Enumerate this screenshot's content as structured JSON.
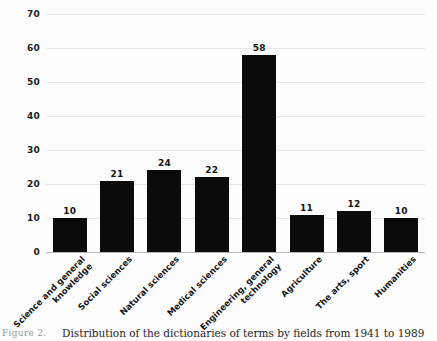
{
  "figure": {
    "caption_label": "Figure 2.",
    "caption_text": "Distribution of the dictionaries of terms by fields from 1941 to 1989",
    "bar_color": "#0b0b0b",
    "grid_color": "#e6e6e6",
    "axis_color": "#b9b9b9",
    "background": "#fdfdfd"
  },
  "chart_data": {
    "type": "bar",
    "title": "",
    "subtitle": "",
    "xlabel": "",
    "ylabel": "",
    "ylim": [
      0,
      70
    ],
    "yticks": [
      0,
      10,
      20,
      30,
      40,
      50,
      60,
      70
    ],
    "ytick_labels": [
      "0",
      "10",
      "20",
      "30",
      "40",
      "50",
      "60",
      "70"
    ],
    "grid": true,
    "legend": false,
    "legend_position": "none",
    "show_data_labels": true,
    "categories": [
      "Science and general knowledge",
      "Social sciences",
      "Natural sciences",
      "Medical sciences",
      "Engineering, general technology",
      "Agriculture",
      "The arts, sport",
      "Humanities"
    ],
    "category_lines": [
      [
        "Science and general",
        "knowledge"
      ],
      [
        "Social sciences"
      ],
      [
        "Natural sciences"
      ],
      [
        "Medical sciences"
      ],
      [
        "Engineering, general",
        "technology"
      ],
      [
        "Agriculture"
      ],
      [
        "The arts, sport"
      ],
      [
        "Humanities"
      ]
    ],
    "values": [
      10,
      21,
      24,
      22,
      58,
      11,
      12,
      10
    ],
    "value_labels": [
      "10",
      "21",
      "24",
      "22",
      "58",
      "11",
      "12",
      "10"
    ]
  }
}
